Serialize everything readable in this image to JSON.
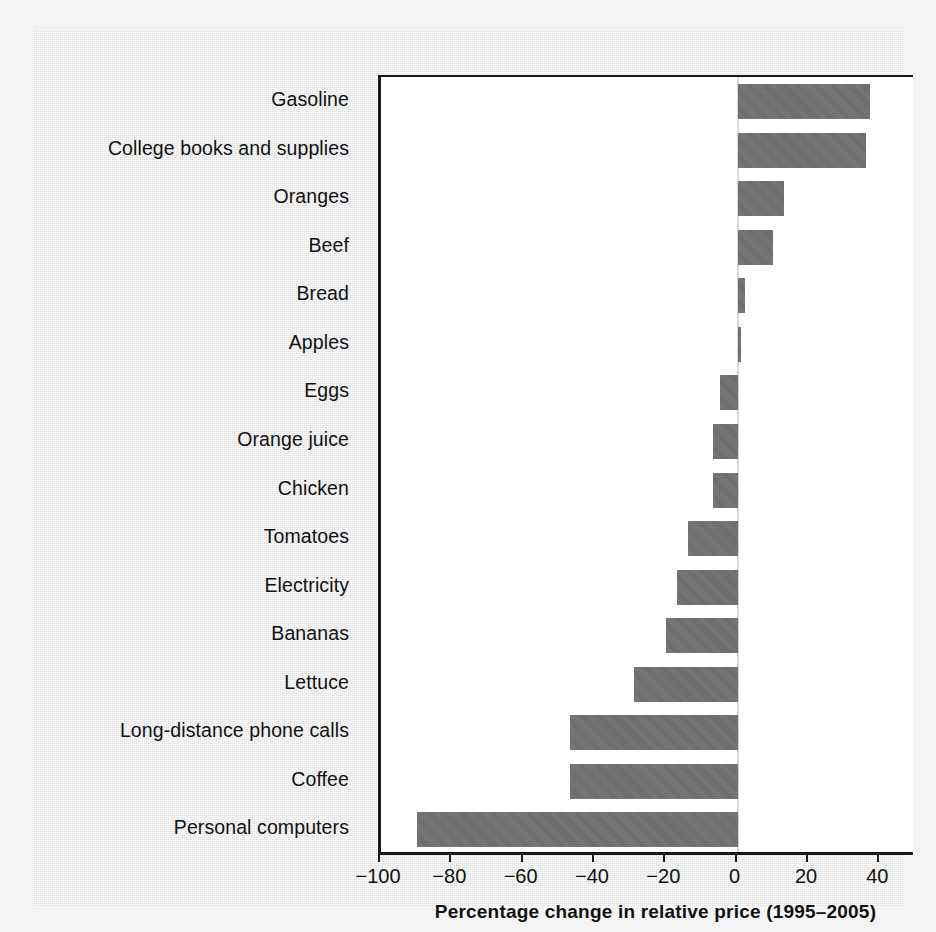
{
  "chart_data": {
    "type": "bar",
    "orientation": "horizontal",
    "title": "",
    "xlabel": "Percentage change in relative price (1995–2005)",
    "ylabel": "",
    "xlim": [
      -100,
      50
    ],
    "xticks": [
      -100,
      -80,
      -60,
      -40,
      -20,
      0,
      20,
      40
    ],
    "xtick_labels": [
      "−100",
      "−80",
      "−60",
      "−40",
      "−20",
      "0",
      "20",
      "40"
    ],
    "grid": false,
    "legend": null,
    "bar_color": "#6f6f6f",
    "plot_background": "#ffffff",
    "page_background": "#e9e9e9",
    "categories": [
      "Gasoline",
      "College books and supplies",
      "Oranges",
      "Beef",
      "Bread",
      "Apples",
      "Eggs",
      "Orange juice",
      "Chicken",
      "Tomatoes",
      "Electricity",
      "Bananas",
      "Lettuce",
      "Long-distance phone calls",
      "Coffee",
      "Personal computers"
    ],
    "values": [
      37,
      36,
      13,
      10,
      2,
      1,
      -5,
      -7,
      -7,
      -14,
      -17,
      -20,
      -29,
      -47,
      -47,
      -90
    ]
  }
}
